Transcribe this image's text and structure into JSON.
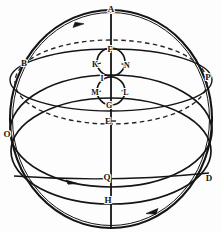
{
  "figure": {
    "width": 222,
    "height": 232,
    "background_color": "#fdfdfd",
    "ink_color": "#141414"
  },
  "geometry": {
    "center": {
      "x": 111,
      "y": 119
    },
    "outer_circle": {
      "cx": 111,
      "cy": 119,
      "rx": 101,
      "ry": 109
    },
    "polar_axis": {
      "x": 111,
      "y1": 14,
      "y2": 228
    },
    "small_circle_upper": {
      "cx": 111,
      "cy": 62,
      "r": 14
    },
    "small_circle_lower": {
      "cx": 111,
      "cy": 91,
      "r": 14
    },
    "ellipses": [
      {
        "name": "equator-solid",
        "cx": 111,
        "cy": 80,
        "rx": 101,
        "ry": 31,
        "style": "solid"
      },
      {
        "name": "tropic-dashed",
        "cx": 111,
        "cy": 82,
        "rx": 96,
        "ry": 42,
        "style": "dashed"
      },
      {
        "name": "horizon-solid",
        "cx": 111,
        "cy": 131,
        "rx": 101,
        "ry": 56,
        "style": "solid"
      },
      {
        "name": "ecliptic-solid",
        "cx": 111,
        "cy": 151,
        "rx": 100,
        "ry": 53,
        "style": "solid"
      }
    ]
  },
  "labels": [
    {
      "id": "A",
      "text": "A",
      "x": 111,
      "y": 9,
      "note": "north pole, top of axis"
    },
    {
      "id": "B",
      "text": "B",
      "x": 24,
      "y": 63,
      "note": "upper left on sphere"
    },
    {
      "id": "P",
      "text": "P",
      "x": 208,
      "y": 77,
      "note": "right limb"
    },
    {
      "id": "O",
      "text": "O",
      "x": 7,
      "y": 134,
      "note": "left limb"
    },
    {
      "id": "D",
      "text": "D",
      "x": 209,
      "y": 178,
      "note": "lower right limb"
    },
    {
      "id": "F",
      "text": "F",
      "x": 110,
      "y": 50,
      "note": "top of upper small circle"
    },
    {
      "id": "K",
      "text": "K",
      "x": 95,
      "y": 65,
      "note": "left of upper small circle"
    },
    {
      "id": "N",
      "text": "N",
      "x": 127,
      "y": 66,
      "note": "right of upper small circle"
    },
    {
      "id": "I",
      "text": "I",
      "x": 102,
      "y": 79,
      "note": "between the two small circles"
    },
    {
      "id": "M",
      "text": "M",
      "x": 95,
      "y": 93,
      "note": "left of lower small circle"
    },
    {
      "id": "L",
      "text": "L",
      "x": 126,
      "y": 93,
      "note": "right of lower small circle"
    },
    {
      "id": "G",
      "text": "G",
      "x": 109,
      "y": 106,
      "note": "bottom of lower small circle"
    },
    {
      "id": "E",
      "text": "E",
      "x": 108,
      "y": 121,
      "note": "on polar axis below G"
    },
    {
      "id": "Q",
      "text": "Q",
      "x": 107,
      "y": 177,
      "note": "on axis at horizon crossing"
    },
    {
      "id": "H",
      "text": "H",
      "x": 108,
      "y": 200,
      "note": "on axis near bottom"
    }
  ],
  "arrows": [
    {
      "id": "arrow-top-left",
      "x": 79,
      "y": 25,
      "direction": "clockwise-top"
    },
    {
      "id": "arrow-bottom-left",
      "x": 72,
      "y": 182,
      "direction": "rightward"
    },
    {
      "id": "arrow-bottom-right",
      "x": 152,
      "y": 212,
      "direction": "leftward"
    }
  ]
}
